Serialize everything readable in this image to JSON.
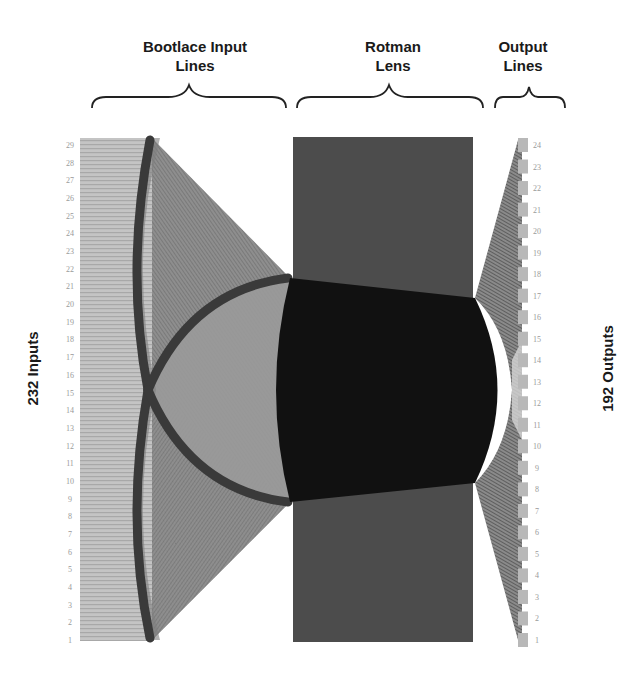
{
  "headers": {
    "bootlace": "Bootlace Input Lines",
    "bootlace_line1": "Bootlace Input",
    "bootlace_line2": "Lines",
    "rotman_line1": "Rotman",
    "rotman_line2": "Lens",
    "output_line1": "Output",
    "output_line2": "Lines"
  },
  "side_labels": {
    "inputs": "232 Inputs",
    "outputs": "192 Outputs"
  },
  "input_port_labels": [
    "29",
    "28",
    "27",
    "26",
    "25",
    "24",
    "23",
    "22",
    "21",
    "20",
    "19",
    "18",
    "17",
    "16",
    "15",
    "14",
    "13",
    "12",
    "11",
    "10",
    "9",
    "8",
    "7",
    "6",
    "5",
    "4",
    "3",
    "2",
    "1"
  ],
  "output_port_labels": [
    "24",
    "23",
    "22",
    "21",
    "20",
    "19",
    "18",
    "17",
    "16",
    "15",
    "14",
    "13",
    "12",
    "11",
    "10",
    "9",
    "8",
    "7",
    "6",
    "5",
    "4",
    "3",
    "2",
    "1"
  ],
  "colors": {
    "substrate": "#4a4a4a",
    "lens_body": "#111111",
    "bootlace_fill": "#8c8c8c",
    "bootlace_band": "#3a3a3a",
    "port_strip": "#bdbdbd",
    "output_fan": "#7a7a7a",
    "text": "#1a1a1a"
  }
}
